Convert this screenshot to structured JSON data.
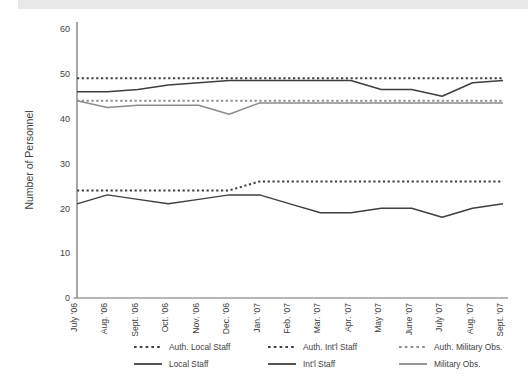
{
  "figure": {
    "background_color": "#ffffff",
    "top_band_color": "#e8e8e8"
  },
  "chart_data": {
    "type": "line",
    "title": "",
    "xlabel": "",
    "ylabel": "Number of Personnel",
    "ylim": [
      0,
      60
    ],
    "ytick_values": [
      0,
      10,
      20,
      30,
      40,
      50,
      60
    ],
    "ytick_labels": [
      "0",
      "10",
      "20",
      "30",
      "40",
      "50",
      "60"
    ],
    "grid": false,
    "legend_position": "below",
    "categories": [
      "July '06",
      "Aug. '06",
      "Sept. '06",
      "Oct. '06",
      "Nov. '06",
      "Dec. '06",
      "Jan. '07",
      "Feb. '07",
      "Mar. '07",
      "Apr. '07",
      "May '07",
      "June '07",
      "July '07",
      "Aug. '07",
      "Sept. '07"
    ],
    "series": [
      {
        "name": "Auth. Local Staff",
        "style": "dashed",
        "color": "#3f3f3f",
        "values": [
          24,
          24,
          24,
          24,
          24,
          24,
          26,
          26,
          26,
          26,
          26,
          26,
          26,
          26,
          26
        ]
      },
      {
        "name": "Auth. Int'l Staff",
        "style": "dashed",
        "color": "#3f3f3f",
        "values": [
          49,
          49,
          49,
          49,
          49,
          49,
          49,
          49,
          49,
          49,
          49,
          49,
          49,
          49,
          49
        ]
      },
      {
        "name": "Auth. Military Obs.",
        "style": "dashed",
        "color": "#8c8c8c",
        "values": [
          44,
          44,
          44,
          44,
          44,
          44,
          44,
          44,
          44,
          44,
          44,
          44,
          44,
          44,
          44
        ]
      },
      {
        "name": "Local Staff",
        "style": "solid",
        "color": "#3f3f3f",
        "values": [
          21,
          23,
          22,
          21,
          22,
          23,
          23,
          21,
          19,
          19,
          20,
          20,
          18,
          20,
          21
        ]
      },
      {
        "name": "Int'l Staff",
        "style": "solid",
        "color": "#3f3f3f",
        "values": [
          46,
          46,
          46.5,
          47.5,
          48,
          48.5,
          48.5,
          48.5,
          48.5,
          48.5,
          46.5,
          46.5,
          45,
          48,
          48.5
        ]
      },
      {
        "name": "Military Obs.",
        "style": "solid",
        "color": "#8c8c8c",
        "values": [
          44,
          42.5,
          43,
          43,
          43,
          41,
          43.5,
          43.5,
          43.5,
          43.5,
          43.5,
          43.5,
          43.5,
          43.5,
          43.5
        ]
      }
    ]
  },
  "legend": {
    "row1": [
      {
        "label": "Auth. Local Staff",
        "style": "dashed",
        "color": "#3f3f3f"
      },
      {
        "label": "Auth. Int'l Staff",
        "style": "dashed",
        "color": "#3f3f3f"
      },
      {
        "label": "Auth. Military Obs.",
        "style": "dashed",
        "color": "#8c8c8c"
      }
    ],
    "row2": [
      {
        "label": "Local Staff",
        "style": "solid",
        "color": "#3f3f3f"
      },
      {
        "label": "Int'l Staff",
        "style": "solid",
        "color": "#3f3f3f"
      },
      {
        "label": "Military Obs.",
        "style": "solid",
        "color": "#8c8c8c"
      }
    ]
  }
}
